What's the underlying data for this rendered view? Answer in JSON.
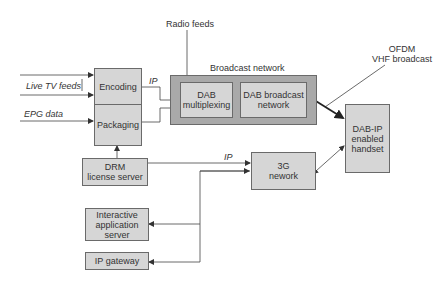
{
  "diagram": {
    "nodes": {
      "encoding": "Encoding",
      "packaging": "Packaging",
      "dab_multiplexing": "DAB\nmultiplexing",
      "dab_broadcast_network": "DAB broadcast\nnetwork",
      "dab_ip_handset": "DAB-IP\nenabled\nhandset",
      "drm_license_server": "DRM\nlicense server",
      "network_3g": "3G\nnework",
      "interactive_app_server": "Interactive\napplication\nserver",
      "ip_gateway": "IP gateway"
    },
    "groups": {
      "broadcast_network": "Broadcast network"
    },
    "labels": {
      "radio_feeds": "Radio feeds",
      "live_tv_feeds": "Live TV feeds",
      "epg_data": "EPG data",
      "ip_encoding": "IP",
      "ip_drm": "IP",
      "ofdm": "OFDM\nVHF broadcast"
    },
    "colors": {
      "box_fill": "#d6d6d6",
      "group_fill": "#a9a9a9",
      "stroke": "#6a6a6a",
      "text": "#333333"
    }
  }
}
